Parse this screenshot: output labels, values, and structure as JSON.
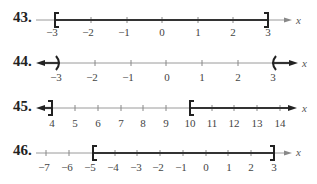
{
  "problems": [
    {
      "number": "43.",
      "axis_label": "x",
      "ticks": [
        "−3",
        "−2",
        "−1",
        "0",
        "1",
        "2",
        "3"
      ],
      "interval": "[-3, 3]",
      "shading": "closed interval from −3 to 3",
      "left_endpoint": {
        "value": "−3",
        "symbol": "["
      },
      "right_endpoint": {
        "value": "3",
        "symbol": "]"
      }
    },
    {
      "number": "44.",
      "axis_label": "x",
      "ticks": [
        "−3",
        "−2",
        "−1",
        "0",
        "1",
        "2",
        "3"
      ],
      "interval": "(-∞, -3) ∪ (3, ∞)",
      "shading": "left ray to −3 open, right ray from 3 open",
      "left_endpoint": {
        "value": "−3",
        "symbol": ")"
      },
      "right_endpoint": {
        "value": "3",
        "symbol": "("
      }
    },
    {
      "number": "45.",
      "axis_label": "x",
      "ticks": [
        "4",
        "5",
        "6",
        "7",
        "8",
        "9",
        "10",
        "11",
        "12",
        "13",
        "14"
      ],
      "interval": "(-∞, 4] ∪ [10, ∞)",
      "shading": "left ray to 4 closed, right ray from 10 closed",
      "left_endpoint": {
        "value": "4",
        "symbol": "]"
      },
      "right_endpoint": {
        "value": "10",
        "symbol": "["
      }
    },
    {
      "number": "46.",
      "axis_label": "x",
      "ticks": [
        "−7",
        "−6",
        "−5",
        "−4",
        "−3",
        "−2",
        "−1",
        "0",
        "1",
        "2",
        "3"
      ],
      "interval": "[-5, 3]",
      "shading": "closed interval from −5 to 3",
      "left_endpoint": {
        "value": "−5",
        "symbol": "["
      },
      "right_endpoint": {
        "value": "3",
        "symbol": "]"
      }
    }
  ],
  "colors": {
    "axis": "#9a9a9a",
    "shade": "#333333",
    "text": "#444444"
  }
}
